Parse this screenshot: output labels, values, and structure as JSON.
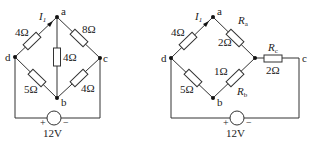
{
  "circuit_left": {
    "nodes": {
      "a": "a",
      "b": "b",
      "c": "c",
      "d": "d"
    },
    "current_label": "I",
    "current_sub": "1",
    "resistors": {
      "da": "4Ω",
      "ac": "8Ω",
      "ab": "4Ω",
      "db": "5Ω",
      "bc": "4Ω"
    },
    "source": {
      "voltage": "12V",
      "plus": "+",
      "minus": "−"
    }
  },
  "circuit_right": {
    "nodes": {
      "a": "a",
      "b": "b",
      "c": "c",
      "d": "d"
    },
    "current_label": "I",
    "current_sub": "1",
    "resistors": {
      "da": "4Ω",
      "Ra_name": "R",
      "Ra_sub": "a",
      "Ra_value": "2Ω",
      "db": "5Ω",
      "Rb_name": "R",
      "Rb_sub": "b",
      "Rb_value": "1Ω",
      "Rc_name": "R",
      "Rc_sub": "c",
      "Rc_value": "2Ω"
    },
    "source": {
      "voltage": "12V",
      "plus": "+",
      "minus": "−"
    }
  }
}
